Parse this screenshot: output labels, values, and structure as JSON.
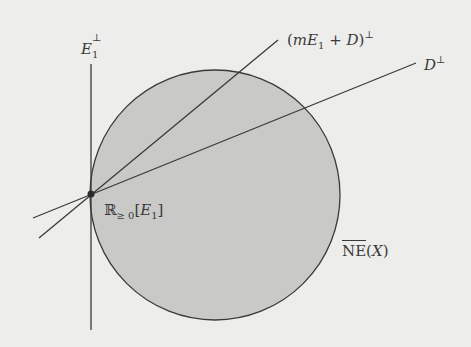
{
  "figure": {
    "colors": {
      "background": "#ededeb",
      "cone_fill": "#c9c9c7",
      "stroke": "#3a3a3a"
    },
    "cone": {
      "cx": 215,
      "cy": 195,
      "r": 125
    },
    "point": {
      "x": 91,
      "y": 194
    },
    "lines": {
      "e1_perp": {
        "x1": 91,
        "y1": 64,
        "x2": 91,
        "y2": 330
      },
      "mE1_plus_D_perp": {
        "x1": 39,
        "y1": 238,
        "x2": 278,
        "y2": 40
      },
      "D_perp": {
        "x1": 33,
        "y1": 218,
        "x2": 416,
        "y2": 63
      }
    },
    "labels": {
      "e1_perp": {
        "base": "E",
        "sub": "1",
        "sup": "⊥"
      },
      "mE1_plus_D_perp": {
        "open": "(",
        "m": "m",
        "E": "E",
        "sub": "1",
        "plus": " + ",
        "D": "D",
        "close": ")",
        "sup": "⊥"
      },
      "D_perp": {
        "base": "D",
        "sup": "⊥"
      },
      "ray": {
        "R": "ℝ",
        "sub": "≥ 0",
        "open": "[",
        "E": "E",
        "esub": "1",
        "close": "]"
      },
      "cone": {
        "ne": "NE",
        "open": "(",
        "X": "X",
        "close": ")"
      }
    }
  }
}
